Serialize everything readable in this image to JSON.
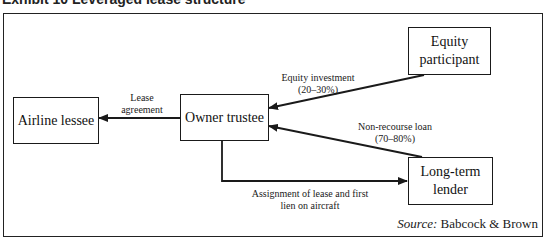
{
  "title": "Exhibit 10 Leveraged lease structure",
  "nodes": {
    "airline_lessee": "Airline lessee",
    "owner_trustee": "Owner trustee",
    "equity_participant": {
      "line1": "Equity",
      "line2": "participant"
    },
    "long_term_lender": {
      "line1": "Long-term",
      "line2": "lender"
    }
  },
  "edges": {
    "lease_agreement": {
      "line1": "Lease",
      "line2": "agreement",
      "from": "Owner trustee",
      "to": "Airline lessee"
    },
    "equity_investment": {
      "line1": "Equity investment",
      "line2": "(20–30%)",
      "from": "Equity participant",
      "to": "Owner trustee"
    },
    "non_recourse_loan": {
      "line1": "Non-recourse loan",
      "line2": "(70–80%)",
      "from": "Long-term lender",
      "to": "Owner trustee"
    },
    "assignment": {
      "line1": "Assignment of lease and first",
      "line2": "lien on aircraft",
      "from": "Owner trustee",
      "to": "Long-term lender"
    }
  },
  "source": {
    "prefix": "Source:",
    "name": "Babcock & Brown"
  },
  "colors": {
    "line": "#1a1a1a",
    "background": "#ffffff"
  }
}
